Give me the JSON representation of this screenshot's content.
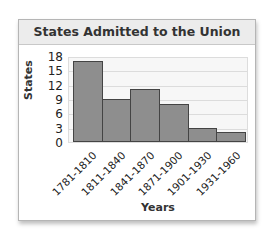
{
  "chart_data": {
    "type": "bar",
    "title": "States Admitted to the Union",
    "xlabel": "Years",
    "ylabel": "States",
    "categories": [
      "1781-1810",
      "1811-1840",
      "1841-1870",
      "1871-1900",
      "1901-1930",
      "1931-1960"
    ],
    "values": [
      17,
      9,
      11,
      8,
      3,
      2
    ],
    "ylim": [
      0,
      18
    ],
    "yticks": [
      "0",
      "3",
      "6",
      "9",
      "12",
      "15",
      "18"
    ],
    "grid": true,
    "legend": null,
    "bar_color": "#8e8e8e"
  }
}
